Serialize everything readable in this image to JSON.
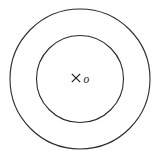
{
  "figure": {
    "name": "concentric-circles-diagram",
    "background_color": "#ffffff",
    "stroke_color": "#2b2b2b",
    "label_color": "#1a1a1a",
    "center_mark": {
      "glyph": "cross-mark",
      "label": "o",
      "label_style": "italic"
    },
    "shapes": {
      "outer_circle": {
        "name": "outer-circle",
        "cx": 80,
        "cy": 79,
        "r": 70
      },
      "inner_circle": {
        "name": "inner-circle",
        "cx": 80,
        "cy": 79,
        "r": 43.5
      }
    },
    "cross": {
      "cx": 76,
      "cy": 78,
      "half_size": 4.2
    },
    "label_position": {
      "x": 84,
      "y": 82
    }
  }
}
